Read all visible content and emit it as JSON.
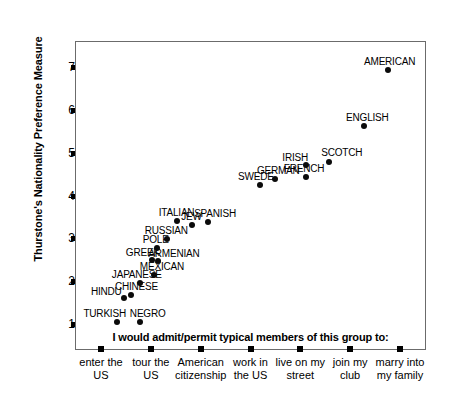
{
  "chart_data": {
    "type": "scatter",
    "title": "",
    "caption": "I would admit/permit typical members of this group to:",
    "ylabel": "Thurstone's Nationality Preference Measure",
    "xlabel": "",
    "ylim": [
      0.4,
      7.6
    ],
    "yticks": [
      1,
      2,
      3,
      4,
      5,
      6,
      7
    ],
    "grid": false,
    "legend": "none",
    "categories": [
      "enter the US",
      "tour the US",
      "American citizenship",
      "work in the US",
      "live on my street",
      "join my club",
      "marry into my family"
    ],
    "category_lines": [
      [
        "enter the",
        "US"
      ],
      [
        "tour the",
        "US"
      ],
      [
        "American",
        "citizenship"
      ],
      [
        "work in",
        "the US"
      ],
      [
        "live on my",
        "street"
      ],
      [
        "join my",
        "club"
      ],
      [
        "marry into",
        "my family"
      ]
    ],
    "points": [
      {
        "label": "TURKISH",
        "x": 0.33,
        "y": 1.05,
        "lx": -34,
        "ly": -13
      },
      {
        "label": "HINDU",
        "x": 0.46,
        "y": 1.62,
        "lx": -33,
        "ly": -11
      },
      {
        "label": "CHINESE",
        "x": 0.6,
        "y": 1.68,
        "lx": -16,
        "ly": -13
      },
      {
        "label": "NEGRO",
        "x": 0.78,
        "y": 1.05,
        "lx": -10,
        "ly": -13
      },
      {
        "label": "JAPANESE",
        "x": 0.78,
        "y": 1.95,
        "lx": -28,
        "ly": -13
      },
      {
        "label": "MEXICAN",
        "x": 1.06,
        "y": 2.15,
        "lx": -14,
        "ly": -13
      },
      {
        "label": "GREEK",
        "x": 1.02,
        "y": 2.5,
        "lx": -26,
        "ly": -12
      },
      {
        "label": "ARMENIAN",
        "x": 1.15,
        "y": 2.48,
        "lx": -10,
        "ly": -12
      },
      {
        "label": "POLE",
        "x": 1.12,
        "y": 2.78,
        "lx": -14,
        "ly": -13
      },
      {
        "label": "RUSSIAN",
        "x": 1.32,
        "y": 2.98,
        "lx": -22,
        "ly": -13
      },
      {
        "label": "ITALIAN",
        "x": 1.52,
        "y": 3.4,
        "lx": -18,
        "ly": -13
      },
      {
        "label": "JEW",
        "x": 1.83,
        "y": 3.32,
        "lx": -11,
        "ly": -13
      },
      {
        "label": "SPANISH",
        "x": 2.15,
        "y": 3.38,
        "lx": -14,
        "ly": -13
      },
      {
        "label": "SWEDE",
        "x": 3.19,
        "y": 4.25,
        "lx": -22,
        "ly": -13
      },
      {
        "label": "GERMAN",
        "x": 3.49,
        "y": 4.38,
        "lx": -18,
        "ly": -13
      },
      {
        "label": "FRENCH",
        "x": 4.11,
        "y": 4.42,
        "lx": -22,
        "ly": -13
      },
      {
        "label": "IRISH",
        "x": 4.12,
        "y": 4.72,
        "lx": -24,
        "ly": -12
      },
      {
        "label": "SCOTCH",
        "x": 4.58,
        "y": 4.78,
        "lx": -8,
        "ly": -14
      },
      {
        "label": "ENGLISH",
        "x": 5.28,
        "y": 5.62,
        "lx": -18,
        "ly": -13
      },
      {
        "label": "AMERICAN",
        "x": 5.76,
        "y": 6.92,
        "lx": -24,
        "ly": -13
      }
    ]
  }
}
